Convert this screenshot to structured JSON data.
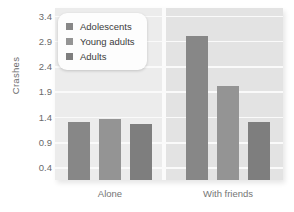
{
  "chart_data": {
    "type": "bar",
    "title": "",
    "subtitle": "",
    "xlabel": "",
    "ylabel": "Crashes",
    "categories": [
      "Alone",
      "With friends"
    ],
    "series": [
      {
        "name": "Adolescents",
        "values": [
          1.3,
          3.0
        ],
        "color": "#878787"
      },
      {
        "name": "Young adults",
        "values": [
          1.35,
          2.0
        ],
        "color": "#949494"
      },
      {
        "name": "Adults",
        "values": [
          1.25,
          1.3
        ],
        "color": "#7e7e7e"
      }
    ],
    "yticks": [
      0.4,
      0.9,
      1.4,
      1.9,
      2.4,
      2.9,
      3.4
    ],
    "ytick_labels": [
      "0.4",
      "0.9",
      "1.4",
      "1.9",
      "2.4",
      "2.9",
      "3.4"
    ],
    "ylim": [
      0.15,
      3.55
    ],
    "grid": true,
    "grid_axis": "y",
    "legend": {
      "position": "upper-left-inside",
      "entries": [
        "Adolescents",
        "Young adults",
        "Adults"
      ]
    },
    "plot_background": "#e8e8e8",
    "gridline_color": "#fafafa",
    "panel_split": true
  }
}
